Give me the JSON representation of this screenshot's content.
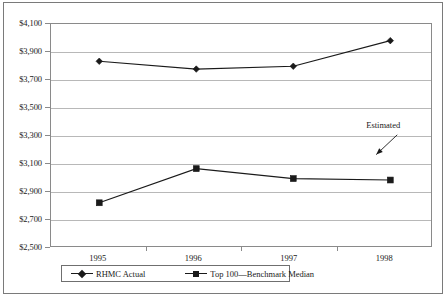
{
  "chart_data": {
    "type": "line",
    "title": "",
    "subtitle": "",
    "xlabel": "",
    "ylabel": "",
    "categories": [
      "1995",
      "1996",
      "1997",
      "1998"
    ],
    "series": [
      {
        "name": "RHMC Actual",
        "marker": "diamond",
        "values": [
          3845,
          3790,
          3810,
          3990
        ]
      },
      {
        "name": "Top 100—Benchmark Median",
        "marker": "square",
        "values": [
          2850,
          3090,
          3020,
          3010
        ]
      }
    ],
    "ylim": [
      2500,
      4100
    ],
    "ytick_step": 200,
    "ytick_labels": [
      "$4,100",
      "$3,900",
      "$3,700",
      "$3,500",
      "$3,300",
      "$3,100",
      "$2,900",
      "$2,700",
      "$2,500"
    ],
    "ytick_values": [
      4100,
      3900,
      3700,
      3500,
      3300,
      3100,
      2900,
      2700,
      2500
    ],
    "xtick_labels": [
      "1995",
      "1996",
      "1997",
      "1998"
    ],
    "grid": "horizontal",
    "legend_position": "bottom",
    "annotations": [
      {
        "text": "Estimated",
        "points_to_series": "Top 100—Benchmark Median",
        "points_to_category": "1998"
      }
    ],
    "colors": {
      "series_line": "#1a1a1a",
      "gridline": "#b8b8b8",
      "axis": "#8a8a8a",
      "frame": "#7a7a7a",
      "background": "#ffffff",
      "text": "#1a1a1a"
    }
  },
  "legend": {
    "items": [
      {
        "label": "RHMC Actual"
      },
      {
        "label": "Top 100—Benchmark Median"
      }
    ]
  },
  "annotation": {
    "estimated_label": "Estimated"
  }
}
